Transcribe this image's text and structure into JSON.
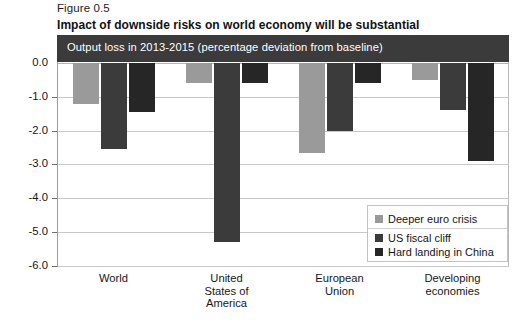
{
  "figure": {
    "number": "Figure 0.5",
    "title": "Impact of downside risks on world economy will be substantial",
    "banner": "Output loss in 2013-2015 (percentage deviation from baseline)"
  },
  "legend": {
    "items": [
      {
        "label": "Deeper euro crisis",
        "color": "#9a9a9a"
      },
      {
        "label": "US fiscal cliff",
        "color": "#3b3b3b"
      },
      {
        "label": "Hard landing in China",
        "color": "#262626"
      }
    ]
  },
  "axis": {
    "y_ticks": [
      "0.0",
      "-1.0",
      "-2.0",
      "-3.0",
      "-4.0",
      "-5.0",
      "-6.0"
    ]
  },
  "categories_display": [
    "World",
    "United\nStates of\nAmerica",
    "European\nUnion",
    "Developing\neconomies"
  ],
  "chart_data": {
    "type": "bar",
    "title": "Impact of downside risks on world economy will be substantial",
    "subtitle": "Output loss in 2013-2015 (percentage deviation from baseline)",
    "xlabel": "",
    "ylabel": "",
    "ylim": [
      -6.0,
      0.0
    ],
    "yticks": [
      0.0,
      -1.0,
      -2.0,
      -3.0,
      -4.0,
      -5.0,
      -6.0
    ],
    "grid": true,
    "legend_position": "bottom-right",
    "categories": [
      "World",
      "United States of America",
      "European Union",
      "Developing economies"
    ],
    "series": [
      {
        "name": "Deeper euro crisis",
        "color": "#9a9a9a",
        "values": [
          -1.2,
          -0.6,
          -2.65,
          -0.5
        ]
      },
      {
        "name": "US fiscal cliff",
        "color": "#3b3b3b",
        "values": [
          -2.55,
          -5.3,
          -2.0,
          -1.4
        ]
      },
      {
        "name": "Hard landing in China",
        "color": "#262626",
        "values": [
          -1.45,
          -0.6,
          -0.6,
          -2.9
        ]
      }
    ]
  }
}
